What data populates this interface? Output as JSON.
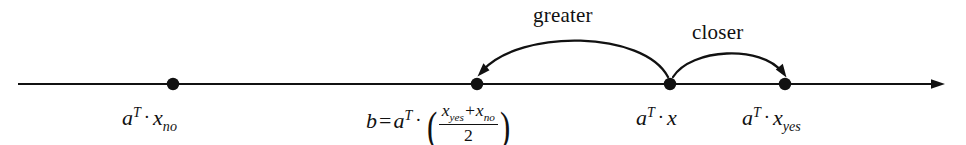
{
  "figure": {
    "background_color": "#ffffff",
    "stroke_color": "#111111"
  },
  "axis": {
    "name": "number-line",
    "x_start": 18,
    "x_end": 945,
    "y": 84,
    "has_right_arrow": true
  },
  "points": [
    {
      "id": "x-no",
      "cx": 173,
      "cy": 84,
      "r": 6
    },
    {
      "id": "b",
      "cx": 477,
      "cy": 84,
      "r": 6
    },
    {
      "id": "x",
      "cx": 670,
      "cy": 84,
      "r": 6
    },
    {
      "id": "x-yes",
      "cx": 785,
      "cy": 84,
      "r": 6
    }
  ],
  "labels": {
    "x_no": {
      "a": "a",
      "sup": "T",
      "dot": "·",
      "base": "x",
      "sub": "no"
    },
    "b": {
      "b": "b",
      "eq": "=",
      "a": "a",
      "sup": "T",
      "dot": "·",
      "open": "(",
      "close": ")",
      "num_x1": "x",
      "num_sub1": "yes",
      "plus": "+",
      "num_x2": "x",
      "num_sub2": "no",
      "den": "2"
    },
    "x": {
      "a": "a",
      "sup": "T",
      "dot": "·",
      "base": "x"
    },
    "x_yes": {
      "a": "a",
      "sup": "T",
      "dot": "·",
      "base": "x",
      "sub": "yes"
    }
  },
  "arcs": [
    {
      "id": "greater-arc",
      "label": "greater",
      "from_point": "x",
      "to_point": "b",
      "direction": "leftward",
      "label_x": 533,
      "label_y": 4,
      "path": "M 668 77 C 640 30 520 30 483 73",
      "arrow_at": "end"
    },
    {
      "id": "closer-arc",
      "label": "closer",
      "from_point": "x",
      "to_point": "x-yes",
      "direction": "rightward",
      "label_x": 692,
      "label_y": 21,
      "path": "M 673 77 C 692 47 760 46 781 74",
      "arrow_at": "end"
    }
  ]
}
